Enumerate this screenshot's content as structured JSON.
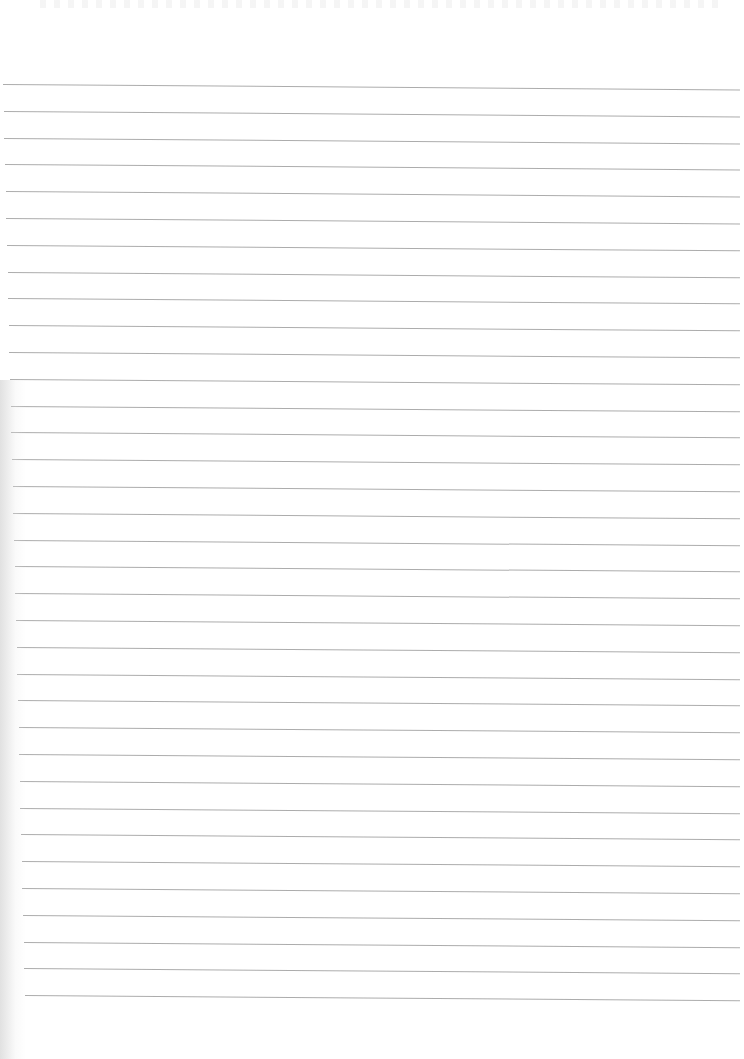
{
  "document": {
    "type": "ruled-paper",
    "line_color": "#a3a3a3",
    "background": "#ffffff",
    "line_count": 35,
    "first_line_y": 84,
    "line_spacing": 26.8,
    "line_end_x": 740,
    "line_start_x_top": 3,
    "line_start_x_bottom": 25
  }
}
